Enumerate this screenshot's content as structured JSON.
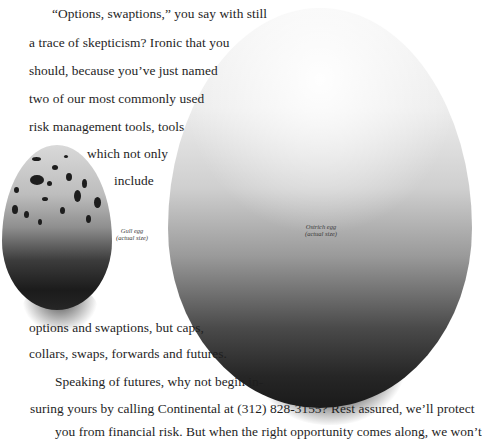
{
  "document": {
    "paragraph_1": [
      "“Options, swaptions,” you say with still",
      "a trace of skepticism?  Ironic that you",
      "should, because you’ve just named",
      "two of our most commonly used",
      "risk management tools, tools",
      "which not only",
      "include",
      "options and swaptions, but caps,",
      "collars, swaps, forwards and futures."
    ],
    "paragraph_2": [
      "Speaking of futures, why not begin in-",
      "suring yours by calling Continental at (312) 828-3155? Rest assured, we’ll protect",
      "you from financial risk. But when the right opportunity comes along, we won’t"
    ]
  },
  "images": {
    "gull_egg": {
      "caption_line1": "Gull egg",
      "caption_line2": "(actual size)"
    },
    "ostrich_egg": {
      "caption_line1": "Ostrich egg",
      "caption_line2": "(actual size)"
    }
  }
}
